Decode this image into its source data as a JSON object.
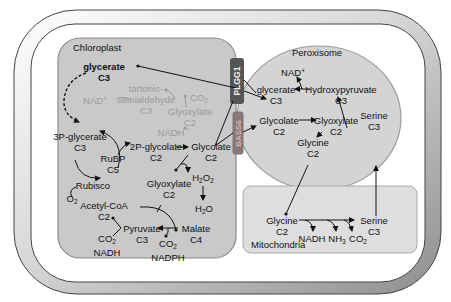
{
  "compartments": {
    "chloroplast": {
      "label": "Chloroplast",
      "fill": "#c9c9c9",
      "stroke": "#8a8a8a"
    },
    "peroxisome": {
      "label": "Peroxisome",
      "fill": "#d4d4d4",
      "stroke": "#9a9a9a"
    },
    "mitochondria": {
      "label": "Mitochondria",
      "fill": "#dedede",
      "stroke": "#aaaaaa"
    },
    "cell": {
      "outer_gradient": [
        "#ffffff",
        "#9a9a9a"
      ],
      "inner_fill": "#ffffff"
    }
  },
  "transporters": {
    "plgg1": {
      "label": "PLGG1",
      "color": "#5a5a5a"
    },
    "bass6": {
      "label": "BASS6",
      "color": "#8f7a7a"
    }
  },
  "chloroplast_nodes": {
    "glycerate": {
      "name": "glycerate",
      "carbons": "C3"
    },
    "tartronic": {
      "name_line1": "tartonic-",
      "name_line2": "semialdehyde",
      "carbons": "C3"
    },
    "nad_plus": "NAD",
    "nad_plus_sup": "+",
    "co2_gray": "CO",
    "co2_gray_sub": "2",
    "glyoxylate_gray": {
      "name": "Glyoxylate",
      "carbons": "C2"
    },
    "nadh_gray": "NADH",
    "pga": {
      "name": "3P-glycerate",
      "carbons": "C3"
    },
    "rubp": {
      "name": "RuBP",
      "carbons": "C5"
    },
    "rubisco": "Rubisco",
    "o2": "O",
    "o2_sub": "2",
    "pglycolate": {
      "name": "2P-glycolate",
      "carbons": "C2"
    },
    "glycolate": {
      "name": "Glycolate",
      "carbons": "C2"
    },
    "glyoxylate": {
      "name": "Glyoxylate",
      "carbons": "C2"
    },
    "h2o2": {
      "a": "H",
      "sub1": "2",
      "b": "O",
      "sub2": "2"
    },
    "h2o": {
      "a": "H",
      "sub1": "2",
      "b": "O"
    },
    "acetylcoa": {
      "name": "Acetyl-CoA",
      "carbons": "C2"
    },
    "pyruvate": {
      "name": "Pyruvate",
      "carbons": "C3"
    },
    "malate": {
      "name": "Malate",
      "carbons": "C4"
    },
    "co2_nadh": {
      "co": "CO",
      "sub": "2",
      "nadh": "NADH"
    },
    "co2_nadph": {
      "co": "CO",
      "sub": "2",
      "nadph": "NADPH"
    }
  },
  "peroxisome_nodes": {
    "nad_plus": "NAD",
    "nad_plus_sup": "+",
    "glycerate": {
      "name": "glycerate",
      "carbons": "C3"
    },
    "hydroxypyruvate": {
      "name": "Hydroxypyruvate",
      "carbons": "C3"
    },
    "glycolate": {
      "name": "Glycolate",
      "carbons": "C2"
    },
    "glyoxylate": {
      "name": "Glyoxylate",
      "carbons": "C2"
    },
    "glycine": {
      "name": "Glycine",
      "carbons": "C2"
    },
    "serine": {
      "name": "Serine",
      "carbons": "C3"
    }
  },
  "mitochondria_nodes": {
    "glycine": {
      "name": "Glycine",
      "carbons": "C2"
    },
    "serine": {
      "name": "Serine",
      "carbons": "C3"
    },
    "nadh": "NADH",
    "nh3": {
      "a": "NH",
      "sub": "3"
    },
    "co2": {
      "a": "CO",
      "sub": "2"
    }
  }
}
